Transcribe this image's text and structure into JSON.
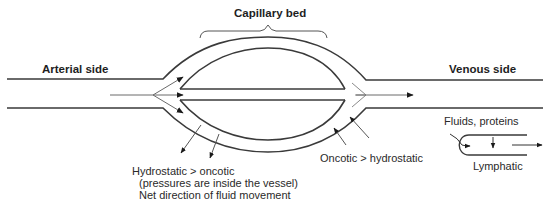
{
  "diagram": {
    "title": "Capillary bed",
    "labels": {
      "arterial_side": "Arterial side",
      "venous_side": "Venous side",
      "capillary_bed": "Capillary bed",
      "fluids_proteins": "Fluids, proteins",
      "lymphatic": "Lymphatic",
      "oncotic_gt_hydrostatic": "Oncotic > hydrostatic",
      "hydrostatic_gt_oncotic": "Hydrostatic > oncotic",
      "pressures_note": "(pressures are inside the vessel)",
      "net_direction": "Net direction of fluid movement"
    },
    "colors": {
      "line": "#3a3a3a",
      "thin_line": "#6a6a6a",
      "arrowhead": "#1a1a1a",
      "background": "#ffffff"
    },
    "nodes": [
      {
        "id": "arterial",
        "label": "Arterial side",
        "type": "vessel"
      },
      {
        "id": "capillary_bed",
        "label": "Capillary bed",
        "type": "vessel-network"
      },
      {
        "id": "venous",
        "label": "Venous side",
        "type": "vessel"
      },
      {
        "id": "lymphatic",
        "label": "Lymphatic",
        "type": "vessel"
      }
    ],
    "edges": [
      {
        "from": "arterial",
        "to": "capillary_bed",
        "label": "blood flow"
      },
      {
        "from": "capillary_bed",
        "to": "venous",
        "label": "blood flow"
      },
      {
        "from": "capillary_bed",
        "to": "interstitium",
        "label": "Hydrostatic > oncotic (filtration, arterial end)"
      },
      {
        "from": "interstitium",
        "to": "capillary_bed",
        "label": "Oncotic > hydrostatic (reabsorption, venous end)"
      },
      {
        "from": "interstitium",
        "to": "lymphatic",
        "label": "Fluids, proteins"
      }
    ]
  }
}
